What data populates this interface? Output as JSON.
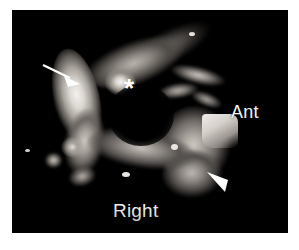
{
  "figure": {
    "modality": "grayscale-ultrasound-3d-reconstruction",
    "frame": {
      "background_color": "#000000",
      "page_color": "#ffffff"
    }
  },
  "labels": {
    "anterior": "Ant",
    "right": "Right"
  },
  "markers": {
    "arrow": {
      "name": "arrow-marker",
      "color": "#ffffff",
      "description": "solid white arrow pointing down-right at the bright left crescent"
    },
    "asterisk": {
      "name": "asterisk-marker",
      "glyph": "*",
      "color": "#ffffff",
      "description": "asterisk over the central cavity"
    },
    "arrowhead": {
      "name": "arrowhead-marker",
      "color": "#ffffff",
      "description": "solid white triangular arrowhead pointing up-left at the lower right mass"
    }
  },
  "colors": {
    "background": "#000000",
    "page": "#ffffff",
    "annotation": "#ffffff",
    "label_text": "#f4f4f4"
  }
}
